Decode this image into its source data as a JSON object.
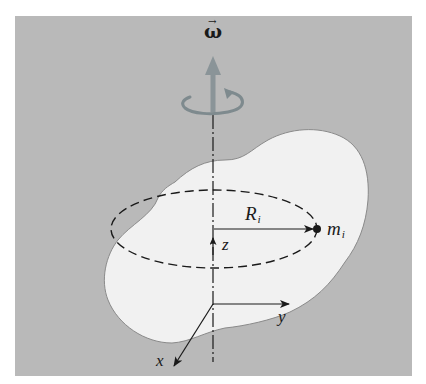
{
  "figure": {
    "labels": {
      "angular_velocity": "ω",
      "angular_velocity_vector_mark": "→",
      "radius_main": "R",
      "radius_sub": "i",
      "mass_main": "m",
      "mass_sub": "i",
      "axis_z": "z",
      "axis_y": "y",
      "axis_x": "x"
    },
    "colors": {
      "background_panel": "#b9b9b9",
      "body_fill": "#f1f1f1",
      "body_outline": "#8a8a8a",
      "rotation_arrow": "#7e8a8e",
      "ink": "#1a1a1a"
    }
  }
}
